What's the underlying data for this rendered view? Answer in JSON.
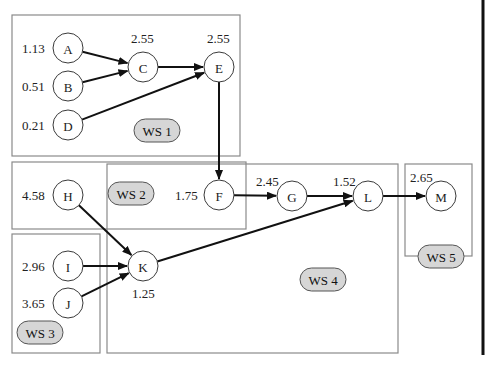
{
  "diagram": {
    "workstations": [
      {
        "id": "ws1",
        "label": "WS 1",
        "box": {
          "x": 12,
          "y": 15,
          "w": 228,
          "h": 141
        },
        "pill": {
          "x": 134,
          "y": 119,
          "w": 46,
          "h": 23
        }
      },
      {
        "id": "ws2",
        "label": "WS 2",
        "box": {
          "x": 12,
          "y": 162,
          "w": 234,
          "h": 67
        },
        "pill": {
          "x": 108,
          "y": 182,
          "w": 46,
          "h": 23
        }
      },
      {
        "id": "ws3",
        "label": "WS 3",
        "box": {
          "x": 12,
          "y": 234,
          "w": 88,
          "h": 119
        },
        "pill": {
          "x": 17,
          "y": 321,
          "w": 46,
          "h": 23
        }
      },
      {
        "id": "ws4",
        "label": "WS 4",
        "box": {
          "x": 107,
          "y": 164,
          "w": 291,
          "h": 189
        },
        "pill": {
          "x": 300,
          "y": 268,
          "w": 46,
          "h": 23
        }
      },
      {
        "id": "ws5",
        "label": "WS 5",
        "box": {
          "x": 405,
          "y": 164,
          "w": 67,
          "h": 92
        },
        "pill": {
          "x": 418,
          "y": 245,
          "w": 46,
          "h": 23
        }
      }
    ],
    "nodes": [
      {
        "id": "A",
        "label": "A",
        "value": "1.13",
        "cx": 68,
        "cy": 48,
        "vx": 22,
        "vy": 48
      },
      {
        "id": "B",
        "label": "B",
        "value": "0.51",
        "cx": 68,
        "cy": 86,
        "vx": 22,
        "vy": 86
      },
      {
        "id": "D",
        "label": "D",
        "value": "0.21",
        "cx": 68,
        "cy": 125,
        "vx": 22,
        "vy": 125
      },
      {
        "id": "C",
        "label": "C",
        "value": "2.55",
        "cx": 143,
        "cy": 67,
        "vx": 131,
        "vy": 38
      },
      {
        "id": "E",
        "label": "E",
        "value": "2.55",
        "cx": 219,
        "cy": 67,
        "vx": 207,
        "vy": 38
      },
      {
        "id": "H",
        "label": "H",
        "value": "4.58",
        "cx": 68,
        "cy": 195,
        "vx": 22,
        "vy": 195
      },
      {
        "id": "F",
        "label": "F",
        "value": "1.75",
        "cx": 219,
        "cy": 195,
        "vx": 175,
        "vy": 195
      },
      {
        "id": "G",
        "label": "G",
        "value": "2.45",
        "cx": 292,
        "cy": 196,
        "vx": 256,
        "vy": 181
      },
      {
        "id": "L",
        "label": "L",
        "value": "1.52",
        "cx": 368,
        "cy": 196,
        "vx": 333,
        "vy": 181
      },
      {
        "id": "M",
        "label": "M",
        "value": "2.65",
        "cx": 441,
        "cy": 196,
        "vx": 410,
        "vy": 177
      },
      {
        "id": "I",
        "label": "I",
        "value": "2.96",
        "cx": 68,
        "cy": 266,
        "vx": 22,
        "vy": 266
      },
      {
        "id": "J",
        "label": "J",
        "value": "3.65",
        "cx": 68,
        "cy": 303,
        "vx": 22,
        "vy": 303
      },
      {
        "id": "K",
        "label": "K",
        "value": "1.25",
        "cx": 143,
        "cy": 266,
        "vx": 132,
        "vy": 293
      }
    ],
    "edges": [
      {
        "from": "A",
        "to": "C"
      },
      {
        "from": "B",
        "to": "C"
      },
      {
        "from": "C",
        "to": "E"
      },
      {
        "from": "D",
        "to": "E"
      },
      {
        "from": "E",
        "to": "F"
      },
      {
        "from": "F",
        "to": "G"
      },
      {
        "from": "G",
        "to": "L"
      },
      {
        "from": "L",
        "to": "M"
      },
      {
        "from": "H",
        "to": "K"
      },
      {
        "from": "I",
        "to": "K"
      },
      {
        "from": "J",
        "to": "K"
      },
      {
        "from": "K",
        "to": "L"
      }
    ],
    "node_radius": 15,
    "colors": {
      "box_stroke": "#8a8a8a",
      "pill_fill": "#d6d6d6",
      "edge": "#111111"
    }
  }
}
